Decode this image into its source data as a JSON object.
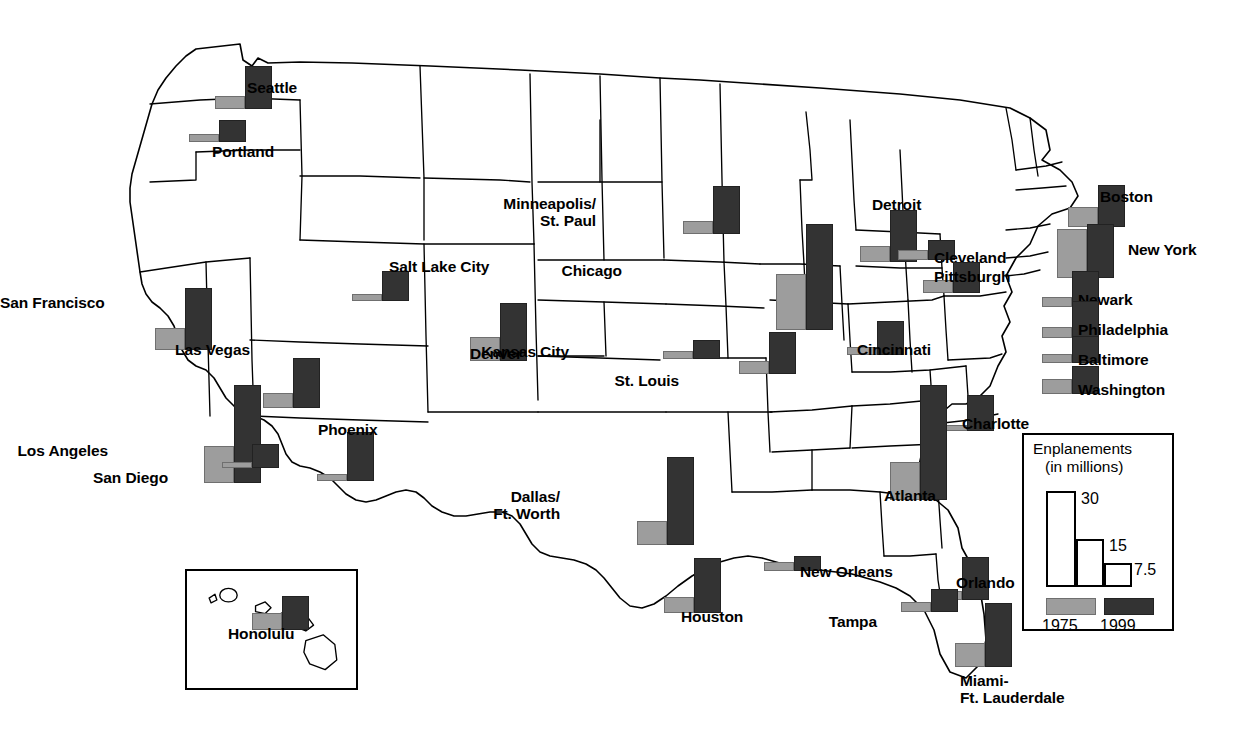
{
  "legend": {
    "title_line1": "Enplanements",
    "title_line2": "(in millions)",
    "scale_labels": [
      "30",
      "15",
      "7.5"
    ],
    "scale_values": [
      30,
      15,
      7.5
    ],
    "series": [
      {
        "name": "1975",
        "color": "#9d9d9d"
      },
      {
        "name": "1999",
        "color": "#333333"
      }
    ]
  },
  "inset": {
    "name": "hawaii-inset"
  },
  "chart_data": {
    "type": "bar",
    "xlabel": "",
    "ylabel": "Enplanements (in millions)",
    "ylim": [
      0,
      36
    ],
    "grid": false,
    "legend_position": "bottom-right",
    "categories": [
      "Seattle",
      "Portland",
      "San Francisco",
      "Los Angeles",
      "San Diego",
      "Las Vegas",
      "Phoenix",
      "Salt Lake City",
      "Denver",
      "Minneapolis/St. Paul",
      "Kansas City",
      "St. Louis",
      "Chicago",
      "Detroit",
      "Cleveland",
      "Pittsburgh",
      "Cincinnati",
      "Boston",
      "New York",
      "Newark",
      "Philadelphia",
      "Baltimore",
      "Washington",
      "Charlotte",
      "Atlanta",
      "Dallas/Ft. Worth",
      "Houston",
      "New Orleans",
      "Orlando",
      "Tampa",
      "Miami-Ft. Lauderdale",
      "Honolulu"
    ],
    "series": [
      {
        "name": "1975",
        "color": "#9d9d9d",
        "values": [
          4.1,
          2.3,
          6.9,
          11.5,
          1.8,
          4.6,
          2.3,
          2.1,
          7.4,
          4.2,
          2.4,
          4.0,
          17.5,
          5.0,
          3.0,
          4.1,
          2.4,
          6.2,
          15.3,
          3.0,
          3.4,
          3.0,
          4.6,
          1.7,
          12.0,
          7.6,
          5.2,
          3.0,
          2.6,
          3.0,
          7.4,
          5.1
        ]
      },
      {
        "name": "1999",
        "color": "#333333",
        "values": [
          13.4,
          6.8,
          19.5,
          30.5,
          7.4,
          15.6,
          15.3,
          9.3,
          18.0,
          15.0,
          5.9,
          13.0,
          33.0,
          16.4,
          6.2,
          9.6,
          10.6,
          13.0,
          17.0,
          11.1,
          11.6,
          8.5,
          8.8,
          11.2,
          36.0,
          27.5,
          17.3,
          4.8,
          13.3,
          7.2,
          20.0,
          10.5
        ]
      }
    ],
    "annotations": [
      "Bar pairs are positioned at each city's geographic location on a U.S. map.",
      "Hawaii is shown in an inset box at lower left.",
      "Legend scale bars correspond to 30, 15, and 7.5 million enplanements."
    ]
  },
  "cities": [
    {
      "name": "Seattle",
      "label": "Seattle",
      "v1975": 4.1,
      "v1999": 13.4,
      "x": 215,
      "y": 66,
      "lx": 247,
      "ly": 79,
      "align": "left"
    },
    {
      "name": "Portland",
      "label": "Portland",
      "v1975": 2.3,
      "v1999": 6.8,
      "x": 189,
      "y": 120,
      "lx": 212,
      "ly": 143,
      "align": "left"
    },
    {
      "name": "San Francisco",
      "label": "San Francisco",
      "v1975": 6.9,
      "v1999": 19.5,
      "x": 155,
      "y": 288,
      "lx": 78,
      "ly": 294,
      "align": "right"
    },
    {
      "name": "Los Angeles",
      "label": "Los Angeles",
      "v1975": 11.5,
      "v1999": 30.5,
      "x": 204,
      "y": 385,
      "lx": 108,
      "ly": 442,
      "align": "right"
    },
    {
      "name": "San Diego",
      "label": "San Diego",
      "v1975": 1.8,
      "v1999": 7.4,
      "x": 222,
      "y": 444,
      "lx": 168,
      "ly": 469,
      "align": "right"
    },
    {
      "name": "Las Vegas",
      "label": "Las Vegas",
      "v1975": 4.6,
      "v1999": 15.6,
      "x": 263,
      "y": 358,
      "lx": 250,
      "ly": 341,
      "align": "right"
    },
    {
      "name": "Phoenix",
      "label": "Phoenix",
      "v1975": 2.3,
      "v1999": 15.3,
      "x": 317,
      "y": 432,
      "lx": 318,
      "ly": 421,
      "align": "left"
    },
    {
      "name": "Salt Lake City",
      "label": "Salt Lake City",
      "v1975": 2.1,
      "v1999": 9.3,
      "x": 352,
      "y": 271,
      "lx": 389,
      "ly": 258,
      "align": "left"
    },
    {
      "name": "Denver",
      "label": "Denver",
      "v1975": 7.4,
      "v1999": 18.0,
      "x": 470,
      "y": 303,
      "lx": 470,
      "ly": 345,
      "align": "left"
    },
    {
      "name": "Minneapolis/St. Paul",
      "label": "Minneapolis/\nSt. Paul",
      "v1975": 4.2,
      "v1999": 15.0,
      "x": 683,
      "y": 186,
      "lx": 596,
      "ly": 195,
      "align": "right"
    },
    {
      "name": "Kansas City",
      "label": "Kansas City",
      "v1975": 2.4,
      "v1999": 5.9,
      "x": 663,
      "y": 340,
      "lx": 569,
      "ly": 343,
      "align": "right"
    },
    {
      "name": "St. Louis",
      "label": "St. Louis",
      "v1975": 4.0,
      "v1999": 13.0,
      "x": 739,
      "y": 332,
      "lx": 679,
      "ly": 372,
      "align": "right"
    },
    {
      "name": "Chicago",
      "label": "Chicago",
      "v1975": 17.5,
      "v1999": 33.0,
      "x": 776,
      "y": 224,
      "lx": 622,
      "ly": 262,
      "align": "right"
    },
    {
      "name": "Detroit",
      "label": "Detroit",
      "v1975": 5.0,
      "v1999": 16.4,
      "x": 860,
      "y": 210,
      "lx": 872,
      "ly": 196,
      "align": "left"
    },
    {
      "name": "Cleveland",
      "label": "Cleveland",
      "v1975": 3.0,
      "v1999": 6.2,
      "x": 898,
      "y": 240,
      "lx": 934,
      "ly": 249,
      "align": "left"
    },
    {
      "name": "Pittsburgh",
      "label": "Pittsburgh",
      "v1975": 4.1,
      "v1999": 9.6,
      "x": 923,
      "y": 262,
      "lx": 934,
      "ly": 268,
      "align": "left"
    },
    {
      "name": "Cincinnati",
      "label": "Cincinnati",
      "v1975": 2.4,
      "v1999": 10.6,
      "x": 847,
      "y": 321,
      "lx": 857,
      "ly": 341,
      "align": "left"
    },
    {
      "name": "Boston",
      "label": "Boston",
      "v1975": 6.2,
      "v1999": 13.0,
      "x": 1068,
      "y": 185,
      "lx": 1100,
      "ly": 188,
      "align": "left"
    },
    {
      "name": "New York",
      "label": "New York",
      "v1975": 15.3,
      "v1999": 17.0,
      "x": 1057,
      "y": 224,
      "lx": 1128,
      "ly": 241,
      "align": "left"
    },
    {
      "name": "Newark",
      "label": "Newark",
      "v1975": 3.0,
      "v1999": 11.1,
      "x": 1042,
      "y": 271,
      "lx": 1078,
      "ly": 291,
      "align": "left"
    },
    {
      "name": "Philadelphia",
      "label": "Philadelphia",
      "v1975": 3.4,
      "v1999": 11.6,
      "x": 1042,
      "y": 301,
      "lx": 1078,
      "ly": 321,
      "align": "left"
    },
    {
      "name": "Baltimore",
      "label": "Baltimore",
      "v1975": 3.0,
      "v1999": 8.5,
      "x": 1042,
      "y": 336,
      "lx": 1078,
      "ly": 351,
      "align": "left"
    },
    {
      "name": "Washington",
      "label": "Washington",
      "v1975": 4.6,
      "v1999": 8.8,
      "x": 1042,
      "y": 366,
      "lx": 1078,
      "ly": 381,
      "align": "left"
    },
    {
      "name": "Charlotte",
      "label": "Charlotte",
      "v1975": 1.7,
      "v1999": 11.2,
      "x": 937,
      "y": 395,
      "lx": 962,
      "ly": 415,
      "align": "left"
    },
    {
      "name": "Atlanta",
      "label": "Atlanta",
      "v1975": 12.0,
      "v1999": 36.0,
      "x": 890,
      "y": 385,
      "lx": 884,
      "ly": 487,
      "align": "left"
    },
    {
      "name": "Dallas/Ft. Worth",
      "label": "Dallas/\nFt. Worth",
      "v1975": 7.6,
      "v1999": 27.5,
      "x": 637,
      "y": 457,
      "lx": 560,
      "ly": 488,
      "align": "right"
    },
    {
      "name": "Houston",
      "label": "Houston",
      "v1975": 5.2,
      "v1999": 17.3,
      "x": 664,
      "y": 558,
      "lx": 681,
      "ly": 608,
      "align": "left"
    },
    {
      "name": "New Orleans",
      "label": "New Orleans",
      "v1975": 3.0,
      "v1999": 4.8,
      "x": 764,
      "y": 556,
      "lx": 800,
      "ly": 563,
      "align": "left"
    },
    {
      "name": "Orlando",
      "label": "Orlando",
      "v1975": 2.6,
      "v1999": 13.3,
      "x": 932,
      "y": 557,
      "lx": 956,
      "ly": 574,
      "align": "left"
    },
    {
      "name": "Tampa",
      "label": "Tampa",
      "v1975": 3.0,
      "v1999": 7.2,
      "x": 901,
      "y": 589,
      "lx": 877,
      "ly": 613,
      "align": "right"
    },
    {
      "name": "Miami-Ft. Lauderdale",
      "label": "Miami-\nFt. Lauderdale",
      "v1975": 7.4,
      "v1999": 20.0,
      "x": 955,
      "y": 603,
      "lx": 960,
      "ly": 672,
      "align": "left"
    },
    {
      "name": "Honolulu",
      "label": "Honolulu",
      "v1975": 5.1,
      "v1999": 10.5,
      "x": 252,
      "y": 596,
      "lx": 228,
      "ly": 625,
      "align": "left"
    }
  ]
}
